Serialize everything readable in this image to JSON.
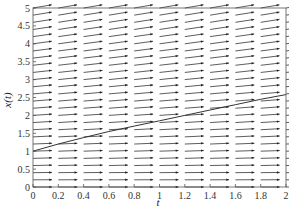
{
  "chart_data": {
    "type": "line",
    "subtype": "direction-field-with-solution",
    "title": "",
    "xlabel": "t",
    "ylabel": "x(t)",
    "xlim": [
      0,
      2
    ],
    "ylim": [
      0,
      5
    ],
    "x_ticks": [
      "0",
      "0.2",
      "0.4",
      "0.6",
      "0.8",
      "1",
      "1.2",
      "1.4",
      "1.6",
      "1.8",
      "2"
    ],
    "y_ticks": [
      "0",
      "0.5",
      "1",
      "1.5",
      "2",
      "2.5",
      "3",
      "3.5",
      "4",
      "4.5",
      "5"
    ],
    "grid": false,
    "legend": null,
    "direction_field": {
      "t_columns": 11,
      "x_rows": 26,
      "description": "Arrows nearly horizontal, slope increasing slightly with x"
    },
    "series": [
      {
        "name": "solution",
        "x": [
          0,
          0.2,
          0.4,
          0.6,
          0.8,
          1.0,
          1.2,
          1.4,
          1.6,
          1.8,
          2.0
        ],
        "values": [
          1.0,
          1.2,
          1.38,
          1.55,
          1.7,
          1.85,
          2.0,
          2.15,
          2.3,
          2.45,
          2.58
        ]
      }
    ],
    "colors": {
      "axis": "#444444",
      "arrow": "#333333",
      "curve": "#333333"
    }
  }
}
